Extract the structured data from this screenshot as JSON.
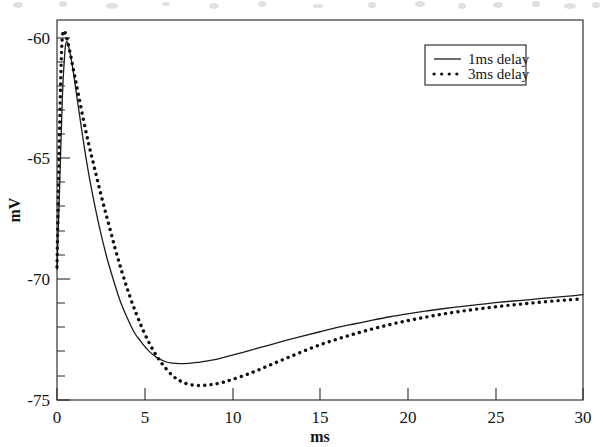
{
  "figure": {
    "background_color": "#ffffff",
    "ink_color": "#1a1a1a"
  },
  "chart_data": {
    "type": "line",
    "title": "",
    "subtitle": "",
    "xlabel": "ms",
    "ylabel": "mV",
    "xlim": [
      0,
      30
    ],
    "ylim": [
      -75,
      -59.3
    ],
    "grid": false,
    "legend_position": "top-right",
    "xticks": [
      0,
      5,
      10,
      15,
      20,
      25,
      30
    ],
    "xtick_labels": [
      "0",
      "5",
      "10",
      "15",
      "20",
      "25",
      "30"
    ],
    "x_minor_tick_interval": 1,
    "yticks": [
      -60,
      -65,
      -70,
      -75
    ],
    "ytick_labels": [
      "-60",
      "-65",
      "-70",
      "-75"
    ],
    "y_minor_tick_interval": 1,
    "annotations": [],
    "series": [
      {
        "name": "1ms delay",
        "style": "solid",
        "color": "#1c1c1c",
        "peak": {
          "x": 0.55,
          "y": -60.2
        },
        "trough": {
          "x": 7.0,
          "y": -73.5
        },
        "final": {
          "x": 30,
          "y": -70.6
        },
        "x": [
          0,
          0.15,
          0.3,
          0.45,
          0.55,
          0.7,
          0.9,
          1.1,
          1.4,
          1.7,
          2.0,
          2.4,
          2.8,
          3.2,
          3.6,
          4.0,
          4.4,
          4.8,
          5.2,
          5.7,
          6.2,
          6.6,
          7.0,
          7.5,
          8.0,
          8.6,
          9.2,
          10.0,
          11.0,
          12.0,
          13.0,
          14.0,
          15.0,
          16.0,
          17.0,
          18.0,
          19.0,
          20.0,
          21.0,
          22.0,
          23.0,
          24.0,
          25.0,
          26.0,
          27.0,
          28.0,
          29.0,
          30.0
        ],
        "y": [
          -69.6,
          -66.2,
          -62.6,
          -60.6,
          -60.2,
          -60.5,
          -61.3,
          -62.3,
          -63.8,
          -65.2,
          -66.4,
          -67.8,
          -69.0,
          -70.0,
          -70.9,
          -71.6,
          -72.2,
          -72.6,
          -72.95,
          -73.25,
          -73.42,
          -73.48,
          -73.5,
          -73.49,
          -73.45,
          -73.38,
          -73.3,
          -73.15,
          -72.95,
          -72.75,
          -72.55,
          -72.36,
          -72.18,
          -72.0,
          -71.85,
          -71.7,
          -71.56,
          -71.44,
          -71.33,
          -71.23,
          -71.14,
          -71.06,
          -70.98,
          -70.91,
          -70.85,
          -70.78,
          -70.72,
          -70.65
        ]
      },
      {
        "name": "3ms delay",
        "style": "dotted",
        "color": "#111111",
        "peak": {
          "x": 0.35,
          "y": -59.8
        },
        "trough": {
          "x": 8.1,
          "y": -74.4
        },
        "final": {
          "x": 30,
          "y": -70.8
        },
        "x": [
          0,
          0.12,
          0.25,
          0.35,
          0.5,
          0.7,
          0.95,
          1.2,
          1.5,
          1.8,
          2.1,
          2.5,
          2.9,
          3.3,
          3.7,
          4.1,
          4.5,
          4.9,
          5.3,
          5.7,
          6.1,
          6.6,
          7.0,
          7.5,
          8.1,
          8.7,
          9.3,
          10.0,
          11.0,
          12.0,
          13.0,
          14.0,
          15.0,
          16.0,
          17.0,
          18.0,
          19.0,
          20.0,
          21.0,
          22.0,
          23.0,
          24.0,
          25.0,
          26.0,
          27.0,
          28.0,
          29.0,
          30.0
        ],
        "y": [
          -69.5,
          -64.8,
          -60.8,
          -59.8,
          -59.9,
          -60.5,
          -61.4,
          -62.3,
          -63.4,
          -64.4,
          -65.3,
          -66.5,
          -67.6,
          -68.7,
          -69.7,
          -70.6,
          -71.4,
          -72.1,
          -72.7,
          -73.2,
          -73.6,
          -74.0,
          -74.2,
          -74.35,
          -74.4,
          -74.37,
          -74.3,
          -74.15,
          -73.9,
          -73.6,
          -73.3,
          -73.0,
          -72.72,
          -72.48,
          -72.26,
          -72.06,
          -71.88,
          -71.72,
          -71.58,
          -71.45,
          -71.34,
          -71.24,
          -71.15,
          -71.07,
          -71.0,
          -70.93,
          -70.87,
          -70.82
        ]
      }
    ]
  },
  "legend": {
    "entries": [
      {
        "label": "1ms delay",
        "marker": "solid-line-sample"
      },
      {
        "label": "3ms delay",
        "marker": "dotted-line-sample"
      }
    ]
  }
}
